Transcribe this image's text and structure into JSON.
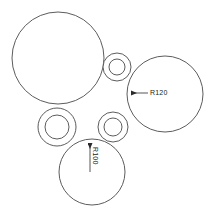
{
  "drawing": {
    "title": "circle-packing-radius-drawing",
    "background_color": "#ffffff",
    "line_color": "#4a4a4a",
    "line_color_dark": "#2b2b2b",
    "text_color": "#1a1a1a",
    "width": 210,
    "height": 210
  },
  "shapes": {
    "circles": [
      {
        "name": "large-circle-top-left",
        "cx": 58,
        "cy": 58,
        "r": 46
      },
      {
        "name": "large-circle-right",
        "cx": 165,
        "cy": 94,
        "r": 38
      },
      {
        "name": "large-circle-bottom",
        "cx": 92,
        "cy": 172,
        "r": 33
      }
    ],
    "annuli": [
      {
        "name": "annulus-top",
        "cx": 117,
        "cy": 67,
        "r_outer": 14,
        "r_inner": 8
      },
      {
        "name": "annulus-left",
        "cx": 57,
        "cy": 127,
        "r_outer": 19,
        "r_inner": 12
      },
      {
        "name": "annulus-middle",
        "cx": 113,
        "cy": 127,
        "r_outer": 15,
        "r_inner": 9
      }
    ]
  },
  "dimensions": [
    {
      "name": "radius-dimension-right",
      "label": "R120",
      "leader_from_x": 128,
      "leader_from_y": 93,
      "leader_to_x": 148,
      "leader_to_y": 93,
      "text_x": 139,
      "text_y": 92,
      "rotation": 0
    },
    {
      "name": "radius-dimension-bottom",
      "label": "R100",
      "leader_from_x": 90,
      "leader_from_y": 140,
      "leader_to_x": 90,
      "leader_to_y": 172,
      "text_x": 92,
      "text_y": 158,
      "rotation": 90
    }
  ]
}
